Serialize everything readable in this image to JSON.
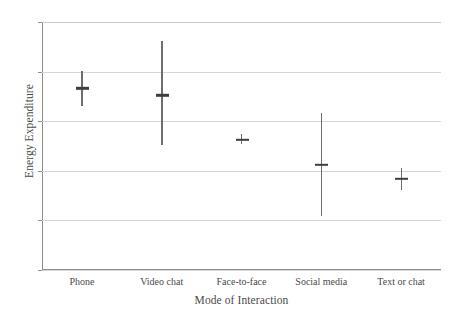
{
  "chart_data": {
    "type": "scatter",
    "title": "",
    "xlabel": "Mode of Interaction",
    "ylabel": "Energy Expenditure",
    "categories": [
      "Phone",
      "Video chat",
      "Face-to-face",
      "Social media",
      "Text or chat"
    ],
    "values": [
      4.33,
      4.26,
      3.81,
      3.56,
      3.42
    ],
    "error_low": [
      4.15,
      3.76,
      3.77,
      3.04,
      3.31
    ],
    "error_high": [
      4.51,
      4.81,
      3.87,
      4.08,
      3.53
    ],
    "ylim": [
      2.5,
      5.0
    ],
    "ytick_labels": [
      "2.5",
      "3.0",
      "3.5",
      "4.0",
      "4.5",
      "5.0"
    ],
    "ytick_values": [
      2.5,
      3.0,
      3.5,
      4.0,
      4.5,
      5.0
    ],
    "grid": true,
    "legend": "none",
    "series": [
      {
        "name": "Estimated marginal mean",
        "values": [
          4.33,
          4.26,
          3.81,
          3.56,
          3.42
        ]
      }
    ],
    "marker_color": "#3d3d3d",
    "errorbar_color": "#6e6e6e",
    "grid_color": "#d6d6d6",
    "axis_color": "#8e8e8e"
  }
}
